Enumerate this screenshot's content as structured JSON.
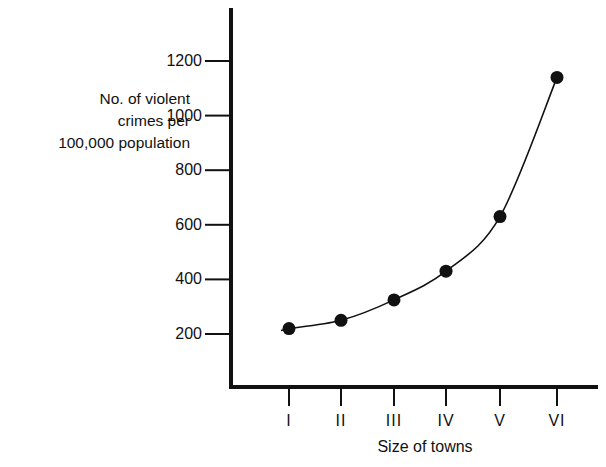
{
  "chart_data": {
    "type": "line",
    "title": "",
    "xlabel": "Size of towns",
    "ylabel": "No. of violent crimes per 100,000 population",
    "ylabel_lines": [
      "No. of violent",
      "crimes per",
      "100,000 population"
    ],
    "categories": [
      "I",
      "II",
      "III",
      "IV",
      "V",
      "VI"
    ],
    "series": [
      {
        "name": "Violent crimes",
        "values": [
          220,
          250,
          325,
          430,
          630,
          1140
        ],
        "marker": "filled-circle",
        "line": "smooth-curve"
      }
    ],
    "yticks": [
      200,
      400,
      600,
      800,
      1000,
      1200
    ],
    "ytick_labels": [
      "200",
      "400",
      "600",
      "800",
      "1000",
      "1200"
    ],
    "ylim": [
      150,
      1350
    ],
    "grid": false,
    "legend": "none",
    "colors": {
      "axis": "#111111",
      "line": "#111111",
      "marker": "#111111",
      "background": "#ffffff"
    }
  }
}
